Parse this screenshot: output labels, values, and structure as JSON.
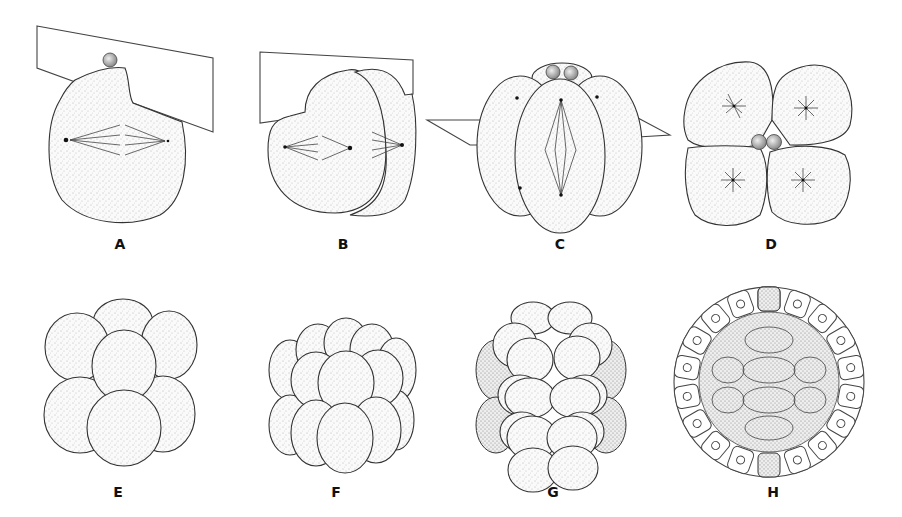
{
  "figure": {
    "colors": {
      "background": "#ffffff",
      "line": "#333333",
      "label": "#111111"
    },
    "panels": [
      {
        "id": "A",
        "label": "A",
        "description": "Zygote with first cleavage plane, polar body and mitotic spindle"
      },
      {
        "id": "B",
        "label": "B",
        "description": "Two-cell stage with second cleavage plane and spindles"
      },
      {
        "id": "C",
        "label": "C",
        "description": "Two-to-four cell transition with horizontal cleavage plane and polar bodies"
      },
      {
        "id": "D",
        "label": "D",
        "description": "Four-cell stage, top view with asters and two polar bodies"
      },
      {
        "id": "E",
        "label": "E",
        "description": "Eight-cell stage"
      },
      {
        "id": "F",
        "label": "F",
        "description": "Sixteen-cell stage"
      },
      {
        "id": "G",
        "label": "G",
        "description": "Thirty-two-cell stage (morula)"
      },
      {
        "id": "H",
        "label": "H",
        "description": "Blastula, cut-away view showing blastocoel and epithelial cells"
      }
    ]
  }
}
